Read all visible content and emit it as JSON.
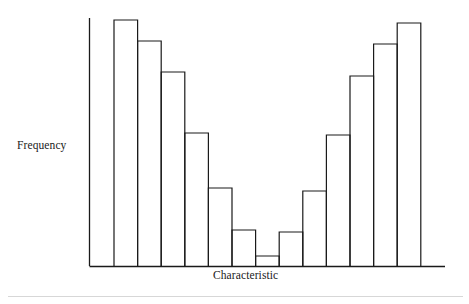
{
  "figure": {
    "title": "",
    "background_color": "#ffffff",
    "line_color": "#1a1a1a",
    "footer_rule_color": "#d7d7d7"
  },
  "labels": {
    "y_axis": "Frequency",
    "x_axis": "Characteristic"
  },
  "chart_data": {
    "type": "bar",
    "title": "",
    "xlabel": "Characteristic",
    "ylabel": "Frequency",
    "categories": [
      "1",
      "2",
      "3",
      "4",
      "5",
      "6",
      "7",
      "8",
      "9",
      "10",
      "11",
      "12",
      "13"
    ],
    "values": [
      100,
      92,
      79,
      54,
      31,
      14,
      4,
      13,
      30,
      53,
      77,
      90,
      99
    ],
    "ylim": [
      0,
      104
    ],
    "grid": false,
    "legend": false,
    "axes": {
      "x_axis_visible": true,
      "y_axis_visible": true,
      "tick_labels_x": [],
      "tick_labels_y": []
    },
    "geometry": {
      "plot_left": 89,
      "plot_right": 445,
      "baseline_y": 266,
      "top_y": 18,
      "bar_start_x": 114,
      "bar_width": 23.6,
      "bar_tops_y": [
        20,
        41,
        72,
        133,
        188,
        230,
        256,
        232,
        191,
        135,
        76,
        44,
        23
      ]
    }
  }
}
